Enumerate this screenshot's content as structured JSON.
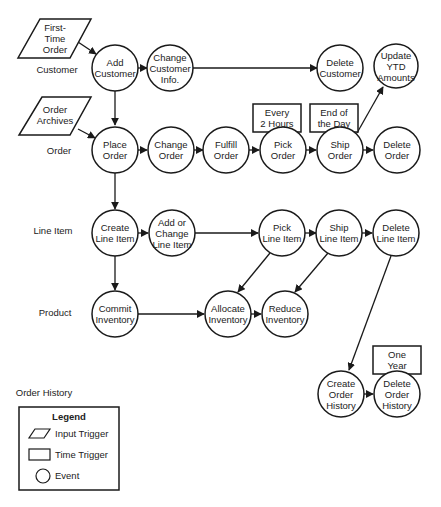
{
  "diagram": {
    "type": "entity-life-history / event diagram",
    "lanes": [
      {
        "id": "customer",
        "label": "Customer"
      },
      {
        "id": "order",
        "label": "Order"
      },
      {
        "id": "line_item",
        "label": "Line Item"
      },
      {
        "id": "product",
        "label": "Product"
      },
      {
        "id": "order_history",
        "label": "Order History"
      }
    ],
    "input_triggers": [
      {
        "id": "first_time_order",
        "lines": [
          "First-",
          "Time",
          "Order"
        ]
      },
      {
        "id": "order_archives",
        "lines": [
          "Order",
          "Archives"
        ]
      }
    ],
    "time_triggers": [
      {
        "id": "every_2_hours",
        "lines": [
          "Every",
          "2 Hours"
        ]
      },
      {
        "id": "end_of_day",
        "lines": [
          "End of",
          "the Day"
        ]
      },
      {
        "id": "one_year",
        "lines": [
          "One",
          "Year"
        ]
      }
    ],
    "events": [
      {
        "id": "add_customer",
        "lines": [
          "Add",
          "Customer"
        ]
      },
      {
        "id": "change_customer_info",
        "lines": [
          "Change",
          "Customer",
          "Info."
        ]
      },
      {
        "id": "delete_customer",
        "lines": [
          "Delete",
          "Customer"
        ]
      },
      {
        "id": "update_ytd",
        "lines": [
          "Update",
          "YTD",
          "Amounts"
        ]
      },
      {
        "id": "place_order",
        "lines": [
          "Place",
          "Order"
        ]
      },
      {
        "id": "change_order",
        "lines": [
          "Change",
          "Order"
        ]
      },
      {
        "id": "fulfill_order",
        "lines": [
          "Fulfill",
          "Order"
        ]
      },
      {
        "id": "pick_order",
        "lines": [
          "Pick",
          "Order"
        ]
      },
      {
        "id": "ship_order",
        "lines": [
          "Ship",
          "Order"
        ]
      },
      {
        "id": "delete_order",
        "lines": [
          "Delete",
          "Order"
        ]
      },
      {
        "id": "create_line_item",
        "lines": [
          "Create",
          "Line Item"
        ]
      },
      {
        "id": "add_change_line_item",
        "lines": [
          "Add or",
          "Change",
          "Line Item"
        ]
      },
      {
        "id": "pick_line_item",
        "lines": [
          "Pick",
          "Line Item"
        ]
      },
      {
        "id": "ship_line_item",
        "lines": [
          "Ship",
          "Line Item"
        ]
      },
      {
        "id": "delete_line_item",
        "lines": [
          "Delete",
          "Line Item"
        ]
      },
      {
        "id": "commit_inventory",
        "lines": [
          "Commit",
          "Inventory"
        ]
      },
      {
        "id": "allocate_inventory",
        "lines": [
          "Allocate",
          "Inventory"
        ]
      },
      {
        "id": "reduce_inventory",
        "lines": [
          "Reduce",
          "Inventory"
        ]
      },
      {
        "id": "create_order_history",
        "lines": [
          "Create",
          "Order",
          "History"
        ]
      },
      {
        "id": "delete_order_history",
        "lines": [
          "Delete",
          "Order",
          "History"
        ]
      }
    ]
  },
  "legend": {
    "title": "Legend",
    "items": [
      {
        "shape": "parallelogram",
        "label": "Input Trigger"
      },
      {
        "shape": "rectangle",
        "label": "Time Trigger"
      },
      {
        "shape": "circle",
        "label": "Event"
      }
    ]
  }
}
